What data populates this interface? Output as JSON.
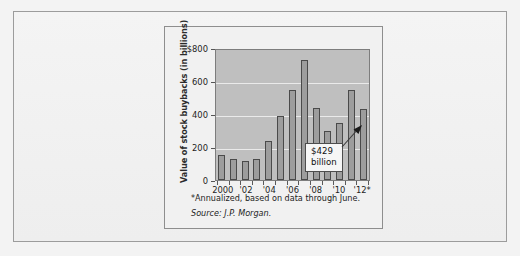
{
  "chart_data": {
    "type": "bar",
    "title": "",
    "xlabel": "",
    "ylabel": "Value of stock buybacks (in billions)",
    "ylim": [
      0,
      800
    ],
    "grid": true,
    "legend": "none",
    "categories": [
      "2000",
      "2001",
      "2002",
      "2003",
      "2004",
      "2005",
      "2006",
      "2007",
      "2008",
      "2009",
      "2010",
      "2011",
      "2012"
    ],
    "values": [
      150,
      125,
      118,
      128,
      235,
      390,
      548,
      730,
      435,
      300,
      345,
      548,
      429
    ],
    "x_tick_labels": [
      "2000",
      "'02",
      "'04",
      "'06",
      "'08",
      "'10",
      "'12*"
    ],
    "x_tick_categories": [
      "2000",
      "2002",
      "2004",
      "2006",
      "2008",
      "2010",
      "2012"
    ],
    "y_tick_labels": [
      "$800",
      "600",
      "400",
      "200",
      "0"
    ],
    "y_tick_values": [
      800,
      600,
      400,
      200,
      0
    ],
    "annotations": [
      {
        "label_line1": "$429",
        "label_line2": "billion",
        "points_to_category": "2012",
        "points_to_value": 429
      }
    ],
    "footnote": "*Annualized, based on data through June.",
    "source": "Source: J.P. Morgan.",
    "colors": {
      "bar_fill": "#9d9d9d",
      "bar_stroke": "#4a4a4a",
      "plot_background": "#bfbfbf",
      "gridline": "#eaeaea",
      "panel_background": "#f1f1f1",
      "text": "#1e1e1e"
    }
  }
}
